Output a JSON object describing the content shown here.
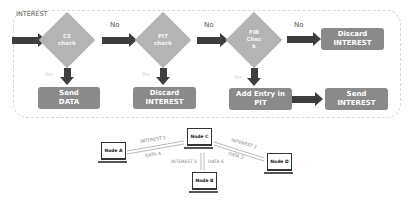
{
  "flowchart": {
    "input_label": "INTEREST",
    "decisions": [
      {
        "id": "cs",
        "label_line1": "CS",
        "label_line2": "check",
        "no_label": "No",
        "yes_label": "Yes"
      },
      {
        "id": "pit",
        "label_line1": "PIT",
        "label_line2": "check",
        "no_label": "No",
        "yes_label": "Yes"
      },
      {
        "id": "fib",
        "label_line1": "FIB",
        "label_line2": "Chec",
        "label_line3": "k",
        "no_label": "No",
        "yes_label": "Yes"
      }
    ],
    "actions": {
      "send_data": {
        "line1": "Send",
        "line2": "DATA"
      },
      "discard_pit": {
        "line1": "Discard",
        "line2": "INTEREST"
      },
      "add_entry": {
        "line1": "Add Entry in",
        "line2": "PIT"
      },
      "send_interest": {
        "line1": "Send",
        "line2": "INTEREST"
      },
      "discard_fib": {
        "line1": "Discard",
        "line2": "INTEREST"
      }
    },
    "colors": {
      "decision": "#b4b4b4",
      "action": "#8a8a8a",
      "arrow": "#3e3e3e"
    }
  },
  "network": {
    "nodes": [
      {
        "id": "a",
        "label": "Node A"
      },
      {
        "id": "c",
        "label": "Node C"
      },
      {
        "id": "d",
        "label": "Node D"
      },
      {
        "id": "b",
        "label": "Node B"
      }
    ],
    "links": [
      {
        "label": "INTEREST 1"
      },
      {
        "label": "DATA 4"
      },
      {
        "label": "INTEREST 2"
      },
      {
        "label": "DATA 3"
      },
      {
        "label": "INTEREST 5"
      },
      {
        "label": "DATA 6"
      }
    ]
  }
}
